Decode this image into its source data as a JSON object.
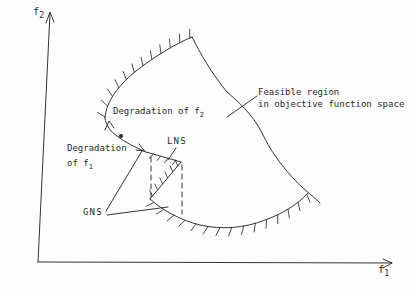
{
  "figure": {
    "colors": {
      "ink": "#2a2a2a",
      "background": "#fdfdfd"
    },
    "axes": {
      "y_label_main": "f",
      "y_label_sub": "2",
      "x_label_main": "f",
      "x_label_sub": "1"
    },
    "annotations": {
      "degradation_f2_text": "Degradation of f",
      "degradation_f2_sub": "2",
      "degradation_f1_line1": "Degradation",
      "degradation_f1_line2_text": "of f",
      "degradation_f1_line2_sub": "1",
      "lns_label": "LNS",
      "gns_label": "GNS",
      "feasible_line1": "Feasible region",
      "feasible_line2": "in objective function space"
    }
  }
}
